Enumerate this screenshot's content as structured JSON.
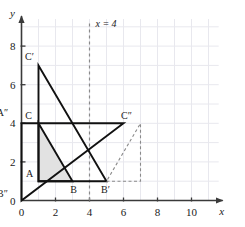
{
  "figure": {
    "title": "",
    "background_color": "#ffffff",
    "axis_color": "#3a3a3a",
    "grid_color": "#e8e8ee",
    "shape_color": "#111111",
    "dashed_color": "#8a8a8a",
    "shade_color": "#e2e2e2"
  },
  "chart_data": {
    "type": "scatter",
    "title": "",
    "xlabel": "x",
    "ylabel": "y",
    "xlim": [
      0,
      11.6
    ],
    "ylim": [
      0,
      9.4
    ],
    "grid": true,
    "grid_step": 1,
    "legend": "none",
    "x_ticks": [
      0,
      2,
      4,
      6,
      8,
      10
    ],
    "x_tick_labels": [
      "0",
      "2",
      "4",
      "6",
      "8",
      "10"
    ],
    "y_ticks": [
      0,
      2,
      4,
      6,
      8
    ],
    "y_tick_labels": [
      "0",
      "2",
      "4",
      "6",
      "8"
    ],
    "annotations": [
      {
        "name": "mirror-line-label",
        "text": "x = 4",
        "x": 4.35,
        "y": 9.0
      }
    ],
    "lines": [
      {
        "name": "mirror-line",
        "label": "x = 4",
        "style": "dashed",
        "x1": 4,
        "y1": 0,
        "x2": 4,
        "y2": 9.3
      }
    ],
    "series": [
      {
        "name": "triangle-ABC",
        "style": "solid-filled",
        "fill": "#e2e2e2",
        "closed": true,
        "points": [
          {
            "label": "A",
            "x": 1,
            "y": 1
          },
          {
            "label": "B",
            "x": 3,
            "y": 1
          },
          {
            "label": "C",
            "x": 1,
            "y": 4
          }
        ]
      },
      {
        "name": "triangle-A-prime-B-prime-C-prime",
        "style": "solid",
        "fill": "none",
        "closed": true,
        "points": [
          {
            "label": "A'",
            "x": 1,
            "y": 1
          },
          {
            "label": "B'",
            "x": 5,
            "y": 1
          },
          {
            "label": "C'",
            "x": 1,
            "y": 7
          }
        ]
      },
      {
        "name": "triangle-A-dprime-B-dprime-C-dprime",
        "style": "solid",
        "fill": "none",
        "closed": true,
        "points": [
          {
            "label": "A″",
            "x": 0,
            "y": 4
          },
          {
            "label": "B″",
            "x": 0,
            "y": 0
          },
          {
            "label": "C″",
            "x": 6,
            "y": 4
          }
        ]
      },
      {
        "name": "construction-triangle-dashed",
        "style": "dashed",
        "fill": "none",
        "closed": true,
        "points": [
          {
            "label": "",
            "x": 5,
            "y": 1
          },
          {
            "label": "",
            "x": 7,
            "y": 1
          },
          {
            "label": "",
            "x": 7,
            "y": 4
          }
        ]
      }
    ],
    "point_labels": [
      {
        "name": "label-A",
        "text": "A",
        "x": 1,
        "y": 1,
        "dx": -9,
        "dy": -4
      },
      {
        "name": "label-B",
        "text": "B",
        "x": 3,
        "y": 1,
        "dx": 1,
        "dy": 12
      },
      {
        "name": "label-C",
        "text": "C",
        "x": 1,
        "y": 4,
        "dx": -10,
        "dy": -4
      },
      {
        "name": "label-C-prime",
        "text": "C′",
        "x": 1,
        "y": 7,
        "dx": -9,
        "dy": -5
      },
      {
        "name": "label-B-prime",
        "text": "B′",
        "x": 5,
        "y": 1,
        "dx": -1,
        "dy": 12
      },
      {
        "name": "label-C-dprime",
        "text": "C″",
        "x": 6,
        "y": 4,
        "dx": 3,
        "dy": -4
      },
      {
        "name": "label-A-dprime",
        "text": "A″",
        "x": 0,
        "y": 4,
        "dx": -19,
        "dy": -7
      },
      {
        "name": "label-B-dprime",
        "text": "B″",
        "x": 0,
        "y": 0,
        "dx": -19,
        "dy": -4
      }
    ]
  }
}
